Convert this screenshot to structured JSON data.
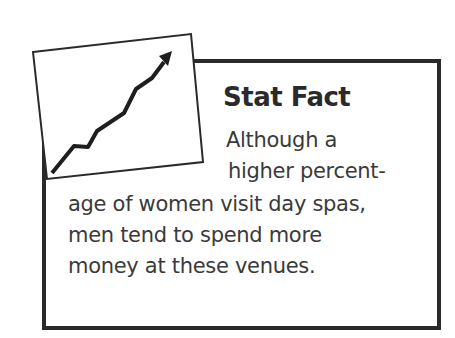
{
  "stat_box": {
    "title": "Stat Fact",
    "lines": [
      "Although a",
      "higher percent-",
      "age of women visit day spas,",
      "men tend to spend more",
      "money at these venues."
    ]
  },
  "icon": "rising-line-graph-icon",
  "colors": {
    "border": "#2a2a2a",
    "text": "#3a3a3a",
    "background": "#ffffff"
  }
}
